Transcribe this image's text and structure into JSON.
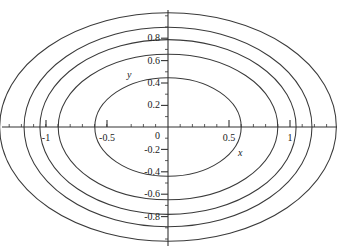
{
  "figure": {
    "background_color": "#ffffff",
    "curve_color": "#333333",
    "axis_color": "#333333",
    "text_color": "#1a1a1a"
  },
  "chart_data": {
    "type": "line",
    "title": "",
    "subtitle": "",
    "xlabel": "x",
    "ylabel": "y",
    "grid": false,
    "legend": "none",
    "xlim": [
      -1.38,
      1.4
    ],
    "ylim": [
      -1.06,
      1.05
    ],
    "x_ticks_major": [
      -1,
      -0.5,
      0,
      0.5,
      1
    ],
    "x_tick_labels": [
      "-1",
      "-0.5",
      "0",
      "0.5",
      "1"
    ],
    "y_ticks_major": [
      -0.8,
      -0.6,
      -0.4,
      -0.2,
      0,
      0.2,
      0.4,
      0.6,
      0.8
    ],
    "y_tick_labels": [
      "-0.8",
      "-0.6",
      "-0.4",
      "-0.2",
      "0",
      "0.2",
      "0.4",
      "0.6",
      "0.8"
    ],
    "x_minor_tick_step": 0.1,
    "y_minor_tick_step": 0.1,
    "series": [
      {
        "name": "contour-1",
        "type": "ellipse",
        "center": [
          0,
          0
        ],
        "semi_x": 0.6,
        "semi_y": 0.44
      },
      {
        "name": "contour-2",
        "type": "ellipse",
        "center": [
          0,
          0
        ],
        "semi_x": 0.9,
        "semi_y": 0.65
      },
      {
        "name": "contour-3",
        "type": "ellipse",
        "center": [
          0,
          0
        ],
        "semi_x": 1.05,
        "semi_y": 0.78
      },
      {
        "name": "contour-4",
        "type": "ellipse",
        "center": [
          0,
          0
        ],
        "semi_x": 1.18,
        "semi_y": 0.89
      },
      {
        "name": "contour-5",
        "type": "ellipse",
        "center": [
          0,
          0
        ],
        "semi_x": 1.38,
        "semi_y": 1.02
      }
    ]
  },
  "axes": {
    "x_label": "x",
    "y_label": "y"
  },
  "x_tick_text": {
    "n1": "-1",
    "n05": "-0.5",
    "zero": "0",
    "p05": "0.5",
    "p1": "1"
  },
  "y_tick_text": {
    "p08": "0.8",
    "p06": "0.6",
    "p04": "0.4",
    "p02": "0.2",
    "m02": "-0.2",
    "m04": "-0.4",
    "m06": "-0.6",
    "m08": "-0.8"
  }
}
